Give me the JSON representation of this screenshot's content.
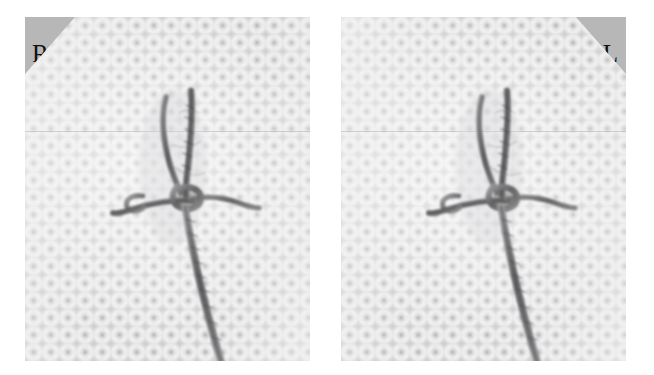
{
  "figure": {
    "name": "stereo-pair-suture-knot",
    "background_color": "#ffffff"
  },
  "panels": [
    {
      "id": "panel-right-eye",
      "label": "R",
      "label_position": "top-left",
      "label_triangle_color": "#b7b7b7",
      "label_text_color": "#111111",
      "subject": "surgical knot on mesh",
      "fabric_color": "#fcfcfc",
      "thread_color": "#6e6e70"
    },
    {
      "id": "panel-left-eye",
      "label": "L",
      "label_position": "top-right",
      "label_triangle_color": "#b7b7b7",
      "label_text_color": "#111111",
      "subject": "surgical knot on mesh",
      "fabric_color": "#fcfcfc",
      "thread_color": "#6e6e70"
    }
  ]
}
